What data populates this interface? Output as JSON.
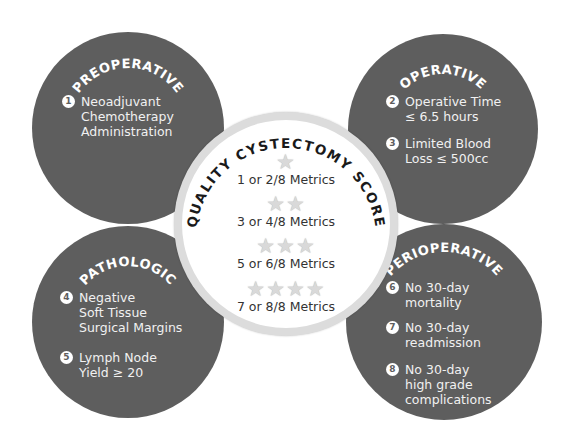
{
  "center": {
    "title": "QUALITY CYSTECTOMY SCORE",
    "tiers": [
      {
        "stars": "★",
        "star_count": 1,
        "label": "1 or 2/8 Metrics"
      },
      {
        "stars": "★★",
        "star_count": 2,
        "label": "3 or 4/8 Metrics"
      },
      {
        "stars": "★★★",
        "star_count": 3,
        "label": "5 or 6/8 Metrics"
      },
      {
        "stars": "★★★★",
        "star_count": 4,
        "label": "7 or 8/8 Metrics"
      }
    ]
  },
  "categories": {
    "preoperative": {
      "title": "PREOPERATIVE",
      "items": [
        {
          "num": "1",
          "text": "Neoadjuvant\nChemotherapy\nAdministration"
        }
      ]
    },
    "operative": {
      "title": "OPERATIVE",
      "items": [
        {
          "num": "2",
          "text": "Operative Time\n≤  6.5 hours"
        },
        {
          "num": "3",
          "text": "Limited Blood\nLoss ≤ 500cc"
        }
      ]
    },
    "pathologic": {
      "title": "PATHOLOGIC",
      "items": [
        {
          "num": "4",
          "text": "Negative\nSoft Tissue\nSurgical Margins"
        },
        {
          "num": "5",
          "text": "Lymph Node\nYield ≥ 20"
        }
      ]
    },
    "perioperative": {
      "title": "PERIOPERATIVE",
      "items": [
        {
          "num": "6",
          "text": "No 30-day\nmortality"
        },
        {
          "num": "7",
          "text": "No 30-day\nreadmission"
        },
        {
          "num": "8",
          "text": "No 30-day\nhigh grade\ncomplications"
        }
      ]
    }
  },
  "colors": {
    "circle_fill": "#5e5e5e",
    "ring": "#dcdcdc",
    "star": "#d9d9d9",
    "text_light": "#f1f1f1",
    "text_dark": "#333333"
  }
}
